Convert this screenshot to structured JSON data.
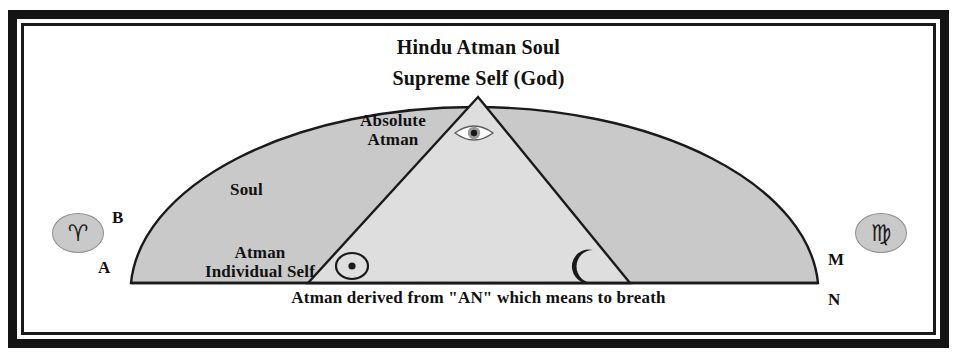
{
  "diagram": {
    "title_line1": "Hindu Atman Soul",
    "title_line2": "Supreme Self (God)",
    "caption": "Atman derived from \"AN\" which means to breath",
    "regions": {
      "absolute_atman": "Absolute\nAtman",
      "absolute_atman_line1": "Absolute",
      "absolute_atman_line2": "Atman",
      "soul": "Soul",
      "individual_line1": "Atman",
      "individual_line2": "Individual Self"
    },
    "points": {
      "A": "A",
      "B": "B",
      "M": "M",
      "N": "N"
    },
    "symbols": {
      "aries": "♈",
      "virgo": "♍",
      "sun": "☉",
      "moon": "☾",
      "eye": "eye-of-providence"
    },
    "colors": {
      "outer_shade": "#c9c9c9",
      "inner_shade": "#dedede",
      "stroke": "#1a1a1a",
      "border": "#141414",
      "background": "#ffffff"
    }
  }
}
